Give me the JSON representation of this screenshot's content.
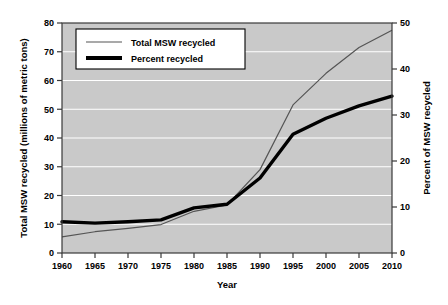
{
  "chart_data": {
    "type": "line",
    "title": "",
    "xlabel": "Year",
    "ylabel": "Total MSW recycled (millions of metric tons)",
    "y2label": "Percent of MSW recycled",
    "xlim": [
      1960,
      2010
    ],
    "ylim": [
      0,
      80
    ],
    "y2lim": [
      0,
      50
    ],
    "grid": true,
    "legend_position": "top-left",
    "xticks": [
      1960,
      1965,
      1970,
      1975,
      1980,
      1985,
      1990,
      1995,
      2000,
      2005,
      2010
    ],
    "yticks": [
      0,
      10,
      20,
      30,
      40,
      50,
      60,
      70,
      80
    ],
    "y2ticks": [
      0,
      10,
      20,
      30,
      40,
      50
    ],
    "x": [
      1960,
      1965,
      1970,
      1975,
      1980,
      1985,
      1990,
      1995,
      2000,
      2005,
      2010
    ],
    "series": [
      {
        "name": "Total MSW recycled",
        "axis": "left",
        "style": "thin",
        "values": [
          5.6,
          7.4,
          8.6,
          9.9,
          14.5,
          16.7,
          29.0,
          51.5,
          62.5,
          71.5,
          77.5
        ]
      },
      {
        "name": "Percent recycled",
        "axis": "right",
        "style": "thick",
        "values": [
          6.8,
          6.5,
          6.8,
          7.2,
          9.8,
          10.6,
          16.3,
          25.8,
          29.3,
          32.0,
          34.1
        ]
      }
    ]
  },
  "axes": {
    "left_title": "Total MSW recycled (millions of metric tons)",
    "right_title": "Percent of MSW recycled",
    "bottom_title": "Year",
    "left_ticks": [
      "80",
      "70",
      "60",
      "50",
      "40",
      "30",
      "20",
      "10",
      "0"
    ],
    "right_ticks": [
      "50",
      "40",
      "30",
      "20",
      "10",
      "0"
    ],
    "bottom_ticks": [
      "1960",
      "1965",
      "1970",
      "1975",
      "1980",
      "1985",
      "1990",
      "1995",
      "2000",
      "2005",
      "2010"
    ]
  },
  "legend": {
    "items": [
      {
        "label": "Total MSW recycled",
        "style": "thin-line"
      },
      {
        "label": "Percent recycled",
        "style": "thick-line"
      }
    ]
  },
  "colors": {
    "plot_background": "#c9c9c9",
    "gridline": "#ffffff",
    "axis": "#3a3a3a",
    "thin_series": "#555555",
    "thick_series": "#000000",
    "page_background": "#ffffff"
  }
}
